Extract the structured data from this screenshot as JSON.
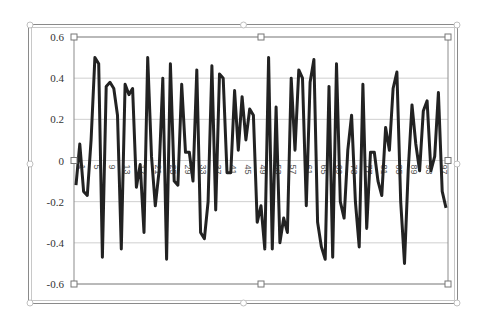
{
  "chart_data": {
    "type": "line",
    "title": "",
    "xlabel": "",
    "ylabel": "",
    "ylim": [
      -0.6,
      0.6
    ],
    "yticks": [
      "0.6",
      "0.4",
      "0.2",
      "0",
      "-0.2",
      "-0.4",
      "-0.6"
    ],
    "ytick_values": [
      0.6,
      0.4,
      0.2,
      0,
      -0.2,
      -0.4,
      -0.6
    ],
    "xticks": [
      "1",
      "5",
      "9",
      "13",
      "17",
      "21",
      "25",
      "29",
      "33",
      "37",
      "41",
      "45",
      "49",
      "53",
      "57",
      "61",
      "65",
      "69",
      "73",
      "77",
      "81",
      "85",
      "89",
      "93",
      "97"
    ],
    "grid": true,
    "legend": "none",
    "series": [
      {
        "name": "Series1",
        "color": "#222222",
        "x_start": 1,
        "values": [
          -0.12,
          0.08,
          -0.15,
          -0.17,
          0.1,
          0.5,
          0.47,
          -0.47,
          0.36,
          0.38,
          0.35,
          0.22,
          -0.43,
          0.37,
          0.32,
          0.35,
          -0.13,
          -0.02,
          -0.35,
          0.5,
          0.02,
          -0.22,
          -0.05,
          0.4,
          -0.48,
          0.47,
          -0.1,
          -0.12,
          0.37,
          0.04,
          0.04,
          -0.1,
          0.44,
          -0.35,
          -0.38,
          -0.2,
          0.46,
          -0.24,
          0.42,
          0.4,
          -0.06,
          -0.06,
          0.34,
          0.05,
          0.31,
          0.1,
          0.25,
          0.22,
          -0.3,
          -0.22,
          -0.43,
          0.5,
          -0.43,
          0.26,
          -0.4,
          -0.28,
          -0.35,
          0.4,
          0.05,
          0.44,
          0.4,
          -0.22,
          0.38,
          0.49,
          -0.3,
          -0.42,
          -0.48,
          0.36,
          -0.47,
          0.47,
          -0.2,
          -0.28,
          0.05,
          0.22,
          -0.2,
          -0.42,
          0.37,
          -0.33,
          0.04,
          0.04,
          -0.1,
          -0.17,
          0.16,
          0.05,
          0.35,
          0.43,
          -0.2,
          -0.5,
          -0.05,
          0.27,
          0.08,
          -0.05,
          0.24,
          0.29,
          -0.05,
          0.02,
          0.33,
          -0.15,
          -0.23
        ]
      }
    ]
  }
}
